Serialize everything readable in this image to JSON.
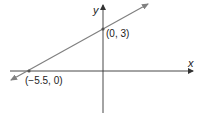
{
  "figure": {
    "type": "coordinate-line-graph",
    "axes": {
      "x_label": "x",
      "y_label": "y"
    },
    "line": {
      "color": "#808080",
      "slope_direction": "positive"
    },
    "points": [
      {
        "label": "(0, 3)",
        "x": 0,
        "y": 3
      },
      {
        "label": "(−5.5, 0)",
        "x": -5.5,
        "y": 0
      }
    ],
    "colors": {
      "axis": "#333333",
      "line": "#808080",
      "point": "#555555"
    }
  }
}
